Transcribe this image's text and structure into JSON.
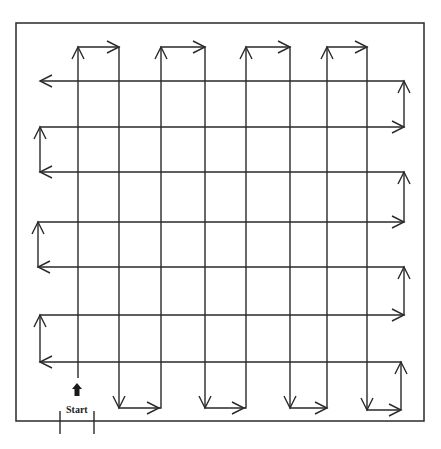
{
  "diagram": {
    "start_label": "Start",
    "colors": {
      "line": "#2a2a2a",
      "background": "#ffffff"
    },
    "boundary": {
      "x1": 16,
      "y1": 23,
      "x2": 424,
      "y2": 421
    },
    "vertical_columns_x": [
      78,
      119,
      161,
      205,
      246,
      290,
      327,
      367
    ],
    "horizontal_rows_y": [
      81,
      127,
      172,
      222,
      267,
      315,
      362
    ],
    "vertical_path": [
      [
        78,
        378
      ],
      [
        78,
        47
      ],
      [
        119,
        47
      ],
      [
        119,
        408
      ],
      [
        159,
        408
      ],
      [
        161,
        408
      ],
      [
        161,
        47
      ],
      [
        205,
        47
      ],
      [
        205,
        408
      ],
      [
        244,
        408
      ],
      [
        246,
        408
      ],
      [
        246,
        47
      ],
      [
        290,
        47
      ],
      [
        290,
        408
      ],
      [
        327,
        408
      ],
      [
        327,
        47
      ],
      [
        367,
        47
      ],
      [
        367,
        410
      ],
      [
        401,
        410
      ]
    ],
    "horizontal_path": [
      [
        401,
        410
      ],
      [
        401,
        362
      ],
      [
        40,
        362
      ],
      [
        40,
        315
      ],
      [
        404,
        315
      ],
      [
        404,
        267
      ],
      [
        38,
        267
      ],
      [
        38,
        222
      ],
      [
        404,
        222
      ],
      [
        404,
        172
      ],
      [
        40,
        172
      ],
      [
        40,
        127
      ],
      [
        404,
        127
      ],
      [
        404,
        81
      ],
      [
        40,
        81
      ]
    ],
    "start_marker": {
      "x": 77,
      "y": 390
    },
    "entrance_ticks_x": [
      60,
      94
    ]
  }
}
